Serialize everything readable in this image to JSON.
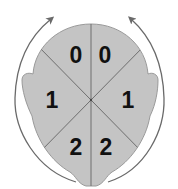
{
  "diagram": {
    "colors": {
      "head_fill": "#c4c4c4",
      "outline": "#8a8a8a",
      "divider": "#6e6e6e",
      "arrow": "#6a6a6a",
      "label": "#111111",
      "background": "#ffffff"
    },
    "sectors": [
      {
        "position": "front-left",
        "score": "0"
      },
      {
        "position": "front-right",
        "score": "0"
      },
      {
        "position": "middle-left",
        "score": "1"
      },
      {
        "position": "middle-right",
        "score": "1"
      },
      {
        "position": "back-left",
        "score": "2"
      },
      {
        "position": "back-right",
        "score": "2"
      }
    ],
    "arrows": [
      {
        "side": "left",
        "direction": "upward-clockwise"
      },
      {
        "side": "right",
        "direction": "upward-counterclockwise"
      }
    ]
  }
}
